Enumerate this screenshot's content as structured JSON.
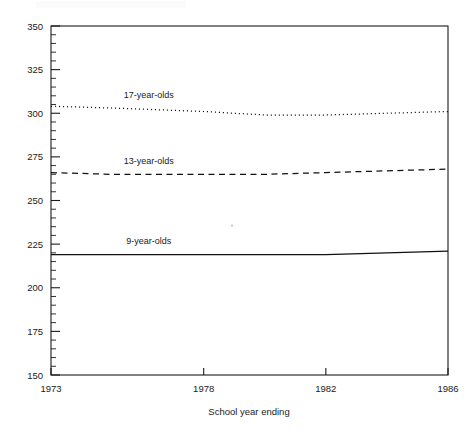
{
  "chart_data": {
    "type": "line",
    "title": "",
    "xlabel": "School year ending",
    "ylabel": "",
    "xlim": [
      1973,
      1986
    ],
    "ylim": [
      150,
      350
    ],
    "grid": false,
    "legend_position": "inline-annotation",
    "x_ticks": [
      "1973",
      "1978",
      "1982",
      "1986"
    ],
    "x_tick_values": [
      1973,
      1978,
      1982,
      1986
    ],
    "y_ticks": [
      "150",
      "175",
      "200",
      "225",
      "250",
      "275",
      "300",
      "325",
      "350"
    ],
    "y_tick_values": [
      150,
      175,
      200,
      225,
      250,
      275,
      300,
      325,
      350
    ],
    "y_minor_step": 5,
    "x": [
      1973,
      1975,
      1978,
      1980,
      1982,
      1984,
      1986
    ],
    "series": [
      {
        "name": "17-year-olds",
        "style": "dotted",
        "values": [
          304,
          303,
          301,
          299,
          299,
          300,
          301
        ],
        "label_x": 1976.2,
        "label_y": 309
      },
      {
        "name": "13-year-olds",
        "style": "dashed",
        "values": [
          266,
          265,
          265,
          265,
          266,
          267,
          268
        ],
        "label_x": 1976.2,
        "label_y": 271
      },
      {
        "name": "9-year-olds",
        "style": "solid",
        "values": [
          219,
          219,
          219,
          219,
          219,
          220,
          221
        ],
        "label_x": 1976.2,
        "label_y": 225
      }
    ]
  },
  "axis": {
    "x_title": "School year ending"
  },
  "colors": {
    "ink": "#1a1a1a",
    "line": "#111111",
    "background": "#ffffff"
  }
}
